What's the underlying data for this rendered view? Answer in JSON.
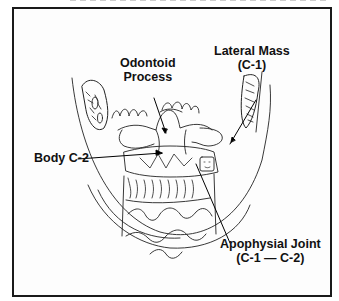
{
  "figure": {
    "type": "anatomical line drawing",
    "labels": {
      "odontoid_line1": "Odontoid",
      "odontoid_line2": "Process",
      "lateral_mass_line1": "Lateral Mass",
      "lateral_mass_line2": "(C-1)",
      "body_c2": "Body C-2",
      "apophysial_line1": "Apophysial Joint",
      "apophysial_line2": "(C-1 — C-2)"
    },
    "colors": {
      "ink": "#111111",
      "border": "#1a1a1a",
      "background": "#ffffff"
    }
  }
}
